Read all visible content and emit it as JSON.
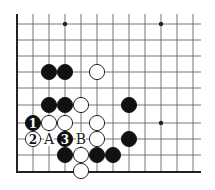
{
  "diagram": {
    "type": "go-board-fragment",
    "grid": {
      "columns_x": [
        17,
        33,
        49,
        65,
        81,
        97,
        113,
        129,
        145,
        161,
        177,
        193
      ],
      "rows_y": [
        24,
        40,
        56,
        72,
        88,
        105,
        123,
        139,
        155,
        172
      ],
      "left_edge_x": 17,
      "bottom_edge_y": 172,
      "right_extent_x": 201,
      "top_extent_y": 14
    },
    "star_points": [
      {
        "x": 65,
        "y": 24
      },
      {
        "x": 161,
        "y": 24
      },
      {
        "x": 161,
        "y": 123
      }
    ],
    "stones": [
      {
        "color": "black",
        "x": 49,
        "y": 72,
        "label": ""
      },
      {
        "color": "black",
        "x": 65,
        "y": 72,
        "label": ""
      },
      {
        "color": "white",
        "x": 97,
        "y": 72,
        "label": ""
      },
      {
        "color": "black",
        "x": 49,
        "y": 105,
        "label": ""
      },
      {
        "color": "black",
        "x": 65,
        "y": 105,
        "label": ""
      },
      {
        "color": "white",
        "x": 81,
        "y": 105,
        "label": ""
      },
      {
        "color": "black",
        "x": 129,
        "y": 105,
        "label": ""
      },
      {
        "color": "black",
        "x": 33,
        "y": 123,
        "label": "1"
      },
      {
        "color": "white",
        "x": 49,
        "y": 123,
        "label": ""
      },
      {
        "color": "white",
        "x": 65,
        "y": 123,
        "label": ""
      },
      {
        "color": "white",
        "x": 97,
        "y": 123,
        "label": ""
      },
      {
        "color": "white",
        "x": 33,
        "y": 139,
        "label": "2"
      },
      {
        "color": "black",
        "x": 65,
        "y": 139,
        "label": "3"
      },
      {
        "color": "white",
        "x": 97,
        "y": 139,
        "label": ""
      },
      {
        "color": "black",
        "x": 129,
        "y": 139,
        "label": ""
      },
      {
        "color": "black",
        "x": 65,
        "y": 155,
        "label": ""
      },
      {
        "color": "white",
        "x": 81,
        "y": 155,
        "label": ""
      },
      {
        "color": "black",
        "x": 97,
        "y": 155,
        "label": ""
      },
      {
        "color": "black",
        "x": 113,
        "y": 155,
        "label": ""
      },
      {
        "color": "white",
        "x": 81,
        "y": 171,
        "label": ""
      }
    ],
    "point_labels": [
      {
        "text": "A",
        "x": 49,
        "y": 139
      },
      {
        "text": "B",
        "x": 81,
        "y": 139
      }
    ],
    "colors": {
      "line": "#555555",
      "edge": "#222222",
      "black_stone": "#111111",
      "white_stone": "#ffffff",
      "background": "#ffffff"
    }
  }
}
